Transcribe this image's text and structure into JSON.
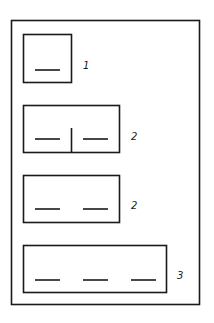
{
  "diagram": {
    "stroke_color": "#1a1a1a",
    "background_color": "#ffffff",
    "groups": [
      {
        "id": "box-1",
        "slots": 1,
        "has_divider": false,
        "label": "1"
      },
      {
        "id": "box-2",
        "slots": 2,
        "has_divider": true,
        "label": "2"
      },
      {
        "id": "box-3",
        "slots": 2,
        "has_divider": false,
        "label": "2"
      },
      {
        "id": "box-4",
        "slots": 3,
        "has_divider": false,
        "label": "3"
      }
    ]
  }
}
